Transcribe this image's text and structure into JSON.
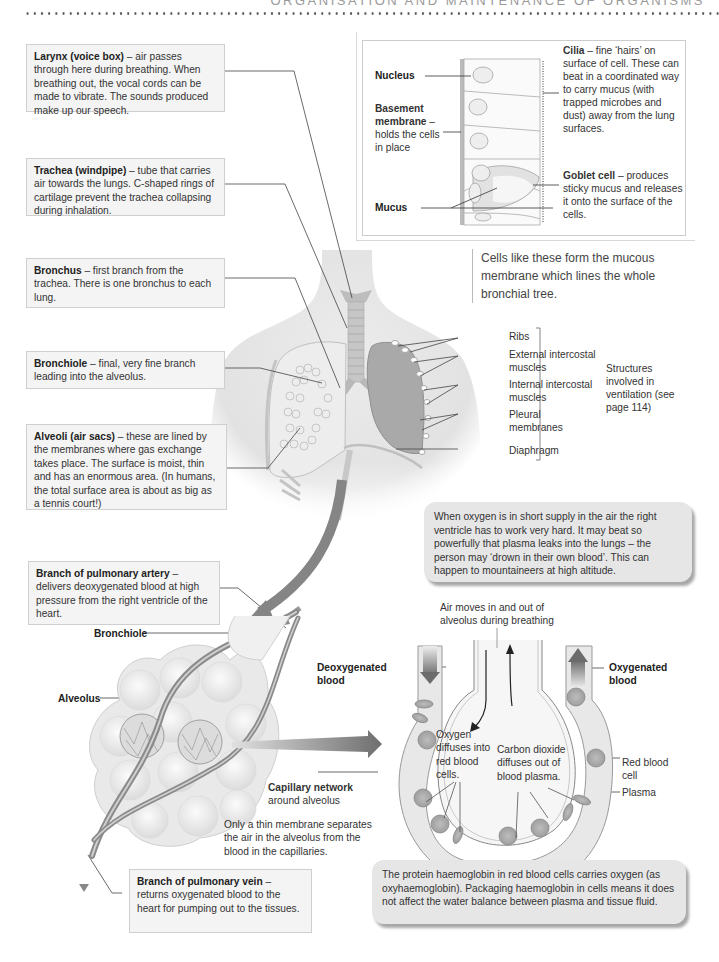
{
  "header": {
    "chapter_title": "ORGANISATION AND MAINTENANCE OF ORGANISMS"
  },
  "left_boxes": [
    {
      "term": "Larynx (voice box)",
      "text": " – air passes through here during breathing. When breathing out, the vocal cords can be made to vibrate. The sounds produced make up our speech."
    },
    {
      "term": "Trachea (windpipe)",
      "text": " – tube that carries air towards the lungs. C-shaped rings of cartilage prevent the trachea collapsing during inhalation."
    },
    {
      "term": "Bronchus",
      "text": " – first branch from the trachea. There is one bronchus to each lung."
    },
    {
      "term": "Bronchiole",
      "text": " – final, very fine branch leading into the alveolus."
    },
    {
      "term": "Alveoli (air sacs)",
      "text": " – these are lined by the membranes where gas exchange takes place. The surface is moist, thin and has an enormous area. (In humans, the total surface area is about as big as a tennis court!)"
    },
    {
      "term": "Branch of pulmonary artery",
      "text": " – delivers deoxygenated blood at high pressure from the right ventricle of the heart."
    },
    {
      "term": "Branch of pulmonary vein",
      "text": " – returns oxygenated blood to the heart for pumping out to the tissues."
    }
  ],
  "cilia_inset": {
    "nucleus": "Nucleus",
    "basement_term": "Basement membrane",
    "basement_text": " – holds the cells in place",
    "mucus": "Mucus",
    "cilia_term": "Cilia",
    "cilia_text": " – fine ‘hairs’ on surface of cell. These can beat in a coordinated way to carry mucus (with trapped microbes and dust) away from the lung surfaces.",
    "goblet_term": "Goblet cell",
    "goblet_text": " – produces sticky mucus and releases it onto the surface of the cells.",
    "caption": "Cells like these form the mucous membrane which lines the whole bronchial tree."
  },
  "ventilation_labels": {
    "items": [
      "Ribs",
      "External intercostal muscles",
      "Internal intercostal muscles",
      "Pleural membranes",
      "Diaphragm"
    ],
    "group_label": "Structures involved in ventilation (see page 114)"
  },
  "callouts": {
    "altitude": "When oxygen is in short supply in the air the right ventricle has to work very hard. It may beat so powerfully that plasma leaks into the lungs – the person may ‘drown in their own blood’. This can happen to mountaineers at high altitude.",
    "haemoglobin": "The protein haemoglobin in red blood cells carries oxygen (as oxyhaemoglobin). Packaging haemoglobin in cells means it does not affect the water balance between plasma and tissue fluid."
  },
  "alveolus_diagram": {
    "bronchiole": "Bronchiole",
    "alveolus": "Alveolus",
    "capillary_term": "Capillary network",
    "capillary_text": "around alveolus",
    "membrane_note": "Only a thin membrane separates the air in the alveolus from the blood in the capillaries."
  },
  "gas_exchange": {
    "air_note": "Air moves in and out of alveolus during breathing",
    "deoxygenated": "Deoxygenated blood",
    "oxygenated": "Oxygenated blood",
    "oxygen_diffuse": "Oxygen diffuses into red blood cells.",
    "co2_diffuse": "Carbon dioxide diffuses out of blood plasma.",
    "red_blood_cell": "Red blood cell",
    "plasma": "Plasma"
  },
  "colors": {
    "box_bg": "#f4f4f4",
    "callout_bg": "#e6e6e6",
    "vessel": "#8a8a8a",
    "arrow": "#7a7a7a"
  }
}
